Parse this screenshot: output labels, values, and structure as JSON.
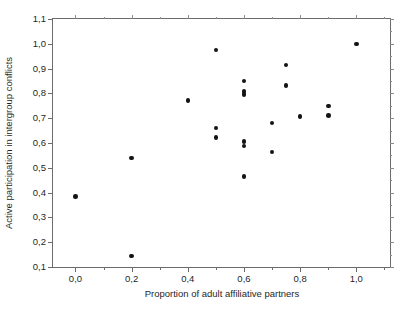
{
  "chart_data": {
    "type": "scatter",
    "title": "",
    "xlabel": "Proportion of adult affiliative partners",
    "ylabel": "Active participation in intergroup conflicts",
    "xlim": [
      -0.08,
      1.12
    ],
    "ylim": [
      0.1,
      1.1
    ],
    "grid": false,
    "legend": null,
    "marker": {
      "shape": "circle",
      "color": "#141414",
      "size": 4.6
    },
    "x_tick_labels": [
      "0,0",
      "0,2",
      "0,4",
      "0,6",
      "0,8",
      "1,0"
    ],
    "x_tick_values": [
      0.0,
      0.2,
      0.4,
      0.6,
      0.8,
      1.0
    ],
    "x_minor_tick_values": [
      0.1,
      0.3,
      0.5,
      0.7,
      0.9,
      1.1
    ],
    "y_tick_labels": [
      "0,1",
      "0,2",
      "0,3",
      "0,4",
      "0,5",
      "0,6",
      "0,7",
      "0,8",
      "0,9",
      "1,0",
      "1,1"
    ],
    "y_tick_values": [
      0.1,
      0.2,
      0.3,
      0.4,
      0.5,
      0.6,
      0.7,
      0.8,
      0.9,
      1.0,
      1.1
    ],
    "points": [
      {
        "x": 0.0,
        "y": 0.385
      },
      {
        "x": 0.2,
        "y": 0.145
      },
      {
        "x": 0.2,
        "y": 0.54
      },
      {
        "x": 0.4,
        "y": 0.772
      },
      {
        "x": 0.5,
        "y": 0.975
      },
      {
        "x": 0.5,
        "y": 0.66
      },
      {
        "x": 0.5,
        "y": 0.622
      },
      {
        "x": 0.6,
        "y": 0.85
      },
      {
        "x": 0.6,
        "y": 0.808
      },
      {
        "x": 0.6,
        "y": 0.795
      },
      {
        "x": 0.6,
        "y": 0.605
      },
      {
        "x": 0.6,
        "y": 0.588
      },
      {
        "x": 0.6,
        "y": 0.465
      },
      {
        "x": 0.7,
        "y": 0.68
      },
      {
        "x": 0.7,
        "y": 0.563
      },
      {
        "x": 0.75,
        "y": 0.915
      },
      {
        "x": 0.75,
        "y": 0.833
      },
      {
        "x": 0.8,
        "y": 0.708
      },
      {
        "x": 0.9,
        "y": 0.75
      },
      {
        "x": 0.9,
        "y": 0.71
      },
      {
        "x": 1.0,
        "y": 1.0
      }
    ]
  }
}
